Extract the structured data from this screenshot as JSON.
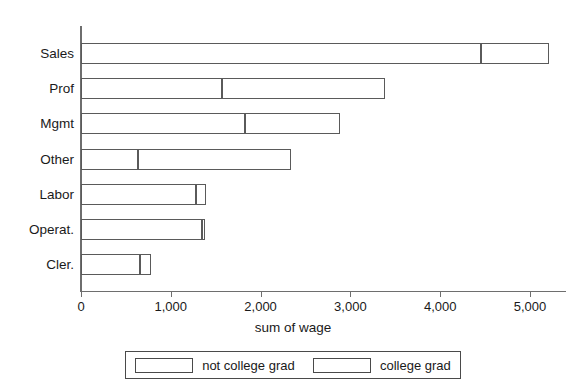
{
  "chart_data": {
    "type": "bar",
    "orientation": "horizontal",
    "stacked": true,
    "title": "",
    "xlabel": "sum of wage",
    "ylabel": "",
    "xlim": [
      0,
      5450
    ],
    "xticks": [
      0,
      1000,
      2000,
      3000,
      4000,
      5000
    ],
    "xtick_labels": [
      "0",
      "1,000",
      "2,000",
      "3,000",
      "4,000",
      "5,000"
    ],
    "grid": false,
    "legend_position": "bottom",
    "categories": [
      "Sales",
      "Prof",
      "Mgmt",
      "Other",
      "Labor",
      "Operat.",
      "Cler."
    ],
    "series": [
      {
        "name": "not college grad",
        "values": [
          4455,
          1570,
          1825,
          635,
          1280,
          1345,
          655
        ]
      },
      {
        "name": "college grad",
        "values": [
          755,
          1815,
          1060,
          1700,
          110,
          35,
          125
        ]
      }
    ],
    "totals": [
      5210,
      3385,
      2885,
      2335,
      1390,
      1380,
      780
    ],
    "colors": {
      "bar_fill": "#ffffff",
      "bar_stroke": "#5a5a5a",
      "axis": "#6e6e6e",
      "text": "#1a1a1a",
      "background": "#ffffff"
    }
  },
  "axis": {
    "x_title": "sum of wage"
  },
  "legend": {
    "items": [
      {
        "label": "not college grad"
      },
      {
        "label": "college grad"
      }
    ]
  }
}
